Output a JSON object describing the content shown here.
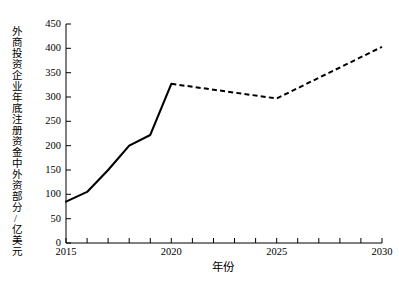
{
  "chart_data": {
    "type": "line",
    "title": "",
    "xlabel": "年份",
    "ylabel": "外商投资企业年底注册资金中外资部分/亿美元",
    "xlim": [
      2015,
      2030
    ],
    "ylim": [
      0,
      450
    ],
    "grid": false,
    "legend": "none",
    "xticks": [
      "2015",
      "2020",
      "2025",
      "2030"
    ],
    "xtick_values": [
      2015,
      2020,
      2025,
      2030
    ],
    "xminor_tick_step": 1,
    "yticks": [
      "0",
      "50",
      "100",
      "150",
      "200",
      "250",
      "300",
      "350",
      "400",
      "450"
    ],
    "ytick_values": [
      0,
      50,
      100,
      150,
      200,
      250,
      300,
      350,
      400,
      450
    ],
    "series": [
      {
        "name": "历史值",
        "style": "solid",
        "color": "#000000",
        "x": [
          2015,
          2016,
          2017,
          2018,
          2019,
          2020
        ],
        "values": [
          85,
          105,
          150,
          200,
          222,
          327
        ]
      },
      {
        "name": "预测值",
        "style": "dashed",
        "color": "#000000",
        "x": [
          2020,
          2025,
          2030
        ],
        "values": [
          327,
          297,
          403
        ]
      }
    ]
  },
  "axes": {
    "y_axis_label": "外商投资企业年底注册资金中外资部分/亿美元",
    "x_axis_label": "年份"
  }
}
